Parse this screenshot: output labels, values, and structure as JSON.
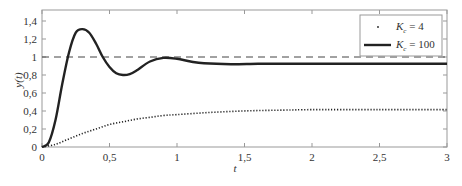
{
  "chart_data": {
    "type": "line",
    "title": "",
    "xlabel": "t",
    "ylabel": "y(t)",
    "xlim": [
      0,
      3
    ],
    "ylim": [
      0,
      1.52
    ],
    "grid": false,
    "legend_position": "upper right",
    "x_ticks": [
      0,
      0.5,
      1,
      1.5,
      2,
      2.5,
      3
    ],
    "x_tick_labels": [
      "0",
      "0,5",
      "1",
      "1,5",
      "2",
      "2,5",
      "3"
    ],
    "y_ticks": [
      0,
      0.2,
      0.4,
      0.6,
      0.8,
      1,
      1.2,
      1.4
    ],
    "y_tick_labels": [
      "0",
      "0,2",
      "0,4",
      "0,6",
      "0,8",
      "1",
      "1,2",
      "1,4"
    ],
    "reference_line": {
      "y": 1,
      "style": "dashed"
    },
    "series": [
      {
        "name": "K_c = 4",
        "legend_main": "K",
        "legend_sub": "c",
        "legend_rest": " = 4",
        "style": "dotted",
        "x": [
          0,
          0.1,
          0.2,
          0.3,
          0.4,
          0.5,
          0.6,
          0.7,
          0.8,
          0.9,
          1.0,
          1.2,
          1.4,
          1.6,
          1.8,
          2.0,
          2.5,
          3.0
        ],
        "values": [
          0,
          0.03,
          0.09,
          0.15,
          0.2,
          0.25,
          0.28,
          0.31,
          0.33,
          0.35,
          0.36,
          0.38,
          0.395,
          0.405,
          0.41,
          0.415,
          0.415,
          0.415
        ]
      },
      {
        "name": "K_c = 100",
        "legend_main": "K",
        "legend_sub": "c",
        "legend_rest": " = 100",
        "style": "solid",
        "x": [
          0,
          0.05,
          0.1,
          0.15,
          0.2,
          0.25,
          0.3,
          0.35,
          0.4,
          0.45,
          0.5,
          0.55,
          0.6,
          0.65,
          0.7,
          0.8,
          0.9,
          1.0,
          1.1,
          1.2,
          1.4,
          1.6,
          1.8,
          2.0,
          2.5,
          3.0
        ],
        "values": [
          0,
          0.05,
          0.3,
          0.7,
          1.05,
          1.27,
          1.31,
          1.27,
          1.15,
          1.0,
          0.89,
          0.82,
          0.8,
          0.81,
          0.85,
          0.95,
          0.99,
          0.98,
          0.95,
          0.93,
          0.92,
          0.925,
          0.925,
          0.925,
          0.925,
          0.925
        ]
      }
    ]
  }
}
